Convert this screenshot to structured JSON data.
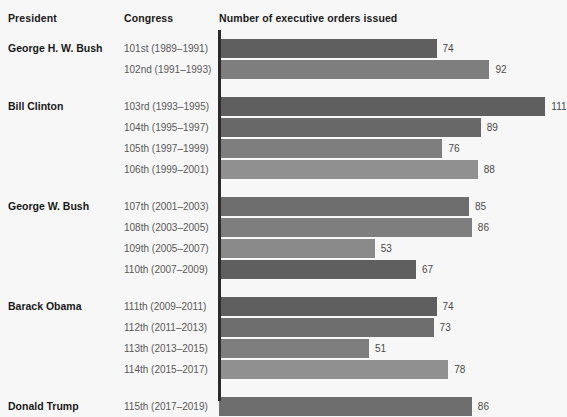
{
  "headers": {
    "president": "President",
    "congress": "Congress",
    "measure": "Number of executive orders issued"
  },
  "palette": {
    "background": "#f7f7f7",
    "axis": "#2b2b2b",
    "shade_1": "#5f5f5f",
    "shade_2": "#6e6e6e",
    "shade_3": "#7e7e7e",
    "shade_4": "#909090",
    "value_text": "#4a4a4a",
    "congress_text": "#595959",
    "president_text": "#1a1a1a"
  },
  "chart_data": {
    "type": "bar",
    "orientation": "horizontal",
    "title": "Number of executive orders issued",
    "xlabel": "Number of executive orders issued",
    "ylabel": "Congress",
    "grid": false,
    "legend": false,
    "xlim": [
      0,
      117
    ],
    "categories": [
      "101st (1989–1991)",
      "102nd (1991–1993)",
      "103rd (1993–1995)",
      "104th (1995–1997)",
      "105th (1997–1999)",
      "106th (1999–2001)",
      "107th (2001–2003)",
      "108th (2003–2005)",
      "109th (2005–2007)",
      "110th (2007–2009)",
      "111th (2009–2011)",
      "112th (2011–2013)",
      "113th (2013–2015)",
      "114th (2015–2017)",
      "115th (2017–2019)"
    ],
    "values": [
      74,
      92,
      111,
      89,
      76,
      88,
      85,
      86,
      53,
      67,
      74,
      73,
      51,
      78,
      86
    ]
  },
  "groups": [
    {
      "president": "George H. W. Bush",
      "rows": [
        {
          "congress": "101st (1989–1991)",
          "value": 74,
          "shade": "#5f5f5f"
        },
        {
          "congress": "102nd (1991–1993)",
          "value": 92,
          "shade": "#7e7e7e"
        }
      ]
    },
    {
      "president": "Bill Clinton",
      "rows": [
        {
          "congress": "103rd (1993–1995)",
          "value": 111,
          "shade": "#5f5f5f"
        },
        {
          "congress": "104th (1995–1997)",
          "value": 89,
          "shade": "#686868"
        },
        {
          "congress": "105th (1997–1999)",
          "value": 76,
          "shade": "#7e7e7e"
        },
        {
          "congress": "106th (1999–2001)",
          "value": 88,
          "shade": "#909090"
        }
      ]
    },
    {
      "president": "George W. Bush",
      "rows": [
        {
          "congress": "107th (2001–2003)",
          "value": 85,
          "shade": "#6e6e6e"
        },
        {
          "congress": "108th (2003–2005)",
          "value": 86,
          "shade": "#7e7e7e"
        },
        {
          "congress": "109th (2005–2007)",
          "value": 53,
          "shade": "#8a8a8a"
        },
        {
          "congress": "110th (2007–2009)",
          "value": 67,
          "shade": "#5f5f5f"
        }
      ]
    },
    {
      "president": "Barack Obama",
      "rows": [
        {
          "congress": "111th (2009–2011)",
          "value": 74,
          "shade": "#5f5f5f"
        },
        {
          "congress": "112th (2011–2013)",
          "value": 73,
          "shade": "#6e6e6e"
        },
        {
          "congress": "113th (2013–2015)",
          "value": 51,
          "shade": "#7e7e7e"
        },
        {
          "congress": "114th (2015–2017)",
          "value": 78,
          "shade": "#909090"
        }
      ]
    },
    {
      "president": "Donald Trump",
      "rows": [
        {
          "congress": "115th (2017–2019)",
          "value": 86,
          "shade": "#6e6e6e"
        }
      ]
    }
  ]
}
